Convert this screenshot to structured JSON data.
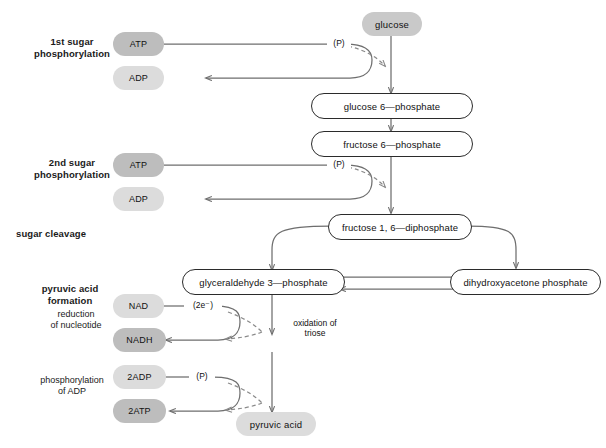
{
  "diagram": {
    "colors": {
      "pill_dark": "#bdbdbd",
      "pill_light": "#dcdcdc",
      "pill_mid": "#c9c9c9",
      "stroke": "#6e6e6e",
      "box_stroke": "#2b2b2b",
      "text": "#111111",
      "background": "#ffffff"
    }
  },
  "stage_labels": [
    {
      "id": "stage-1st-sugar-phosphorylation",
      "text": "1st sugar\nphosphorylation"
    },
    {
      "id": "stage-2nd-sugar-phosphorylation",
      "text": "2nd sugar\nphosphorylation"
    },
    {
      "id": "stage-sugar-cleavage",
      "text": "sugar cleavage"
    },
    {
      "id": "stage-pyruvic-acid-formation",
      "text": "pyruvic acid\nformation"
    }
  ],
  "sub_labels": [
    {
      "id": "sub-reduction-of-nucleotide",
      "text": "reduction\nof nucleotide"
    },
    {
      "id": "sub-phosphorylation-of-adp",
      "text": "phosphorylation\nof ADP"
    }
  ],
  "cofactors": [
    {
      "id": "cofactor-atp-1",
      "label": "ATP",
      "tone": "dark"
    },
    {
      "id": "cofactor-adp-1",
      "label": "ADP",
      "tone": "light"
    },
    {
      "id": "cofactor-atp-2",
      "label": "ATP",
      "tone": "dark"
    },
    {
      "id": "cofactor-adp-2",
      "label": "ADP",
      "tone": "light"
    },
    {
      "id": "cofactor-nad",
      "label": "NAD",
      "tone": "light"
    },
    {
      "id": "cofactor-nadh",
      "label": "NADH",
      "tone": "dark"
    },
    {
      "id": "cofactor-2adp",
      "label": "2ADP",
      "tone": "light"
    },
    {
      "id": "cofactor-2atp",
      "label": "2ATP",
      "tone": "dark"
    }
  ],
  "substrate_pills": [
    {
      "id": "substrate-glucose",
      "label": "glucose",
      "tone": "mid"
    },
    {
      "id": "substrate-pyruvic-acid",
      "label": "pyruvic acid",
      "tone": "light"
    }
  ],
  "metabolite_boxes": [
    {
      "id": "metabolite-glucose-6-phosphate",
      "label": "glucose 6—phosphate"
    },
    {
      "id": "metabolite-fructose-6-phosphate",
      "label": "fructose 6—phosphate"
    },
    {
      "id": "metabolite-fructose-1-6-diphosphate",
      "label": "fructose 1, 6—diphosphate"
    },
    {
      "id": "metabolite-glyceraldehyde-3-phosphate",
      "label": "glyceraldehyde 3—phosphate"
    },
    {
      "id": "metabolite-dihydroxyacetone-phosphate",
      "label": "dihydroxyacetone phosphate"
    }
  ],
  "transfer_notes": [
    {
      "id": "note-phosphate-1",
      "text": "(P)"
    },
    {
      "id": "note-phosphate-2",
      "text": "(P)"
    },
    {
      "id": "note-two-electrons",
      "text": "(2e⁻)"
    },
    {
      "id": "note-phosphate-3",
      "text": "(P)"
    },
    {
      "id": "note-oxidation-of-triose",
      "text": "oxidation of\ntriose"
    }
  ]
}
